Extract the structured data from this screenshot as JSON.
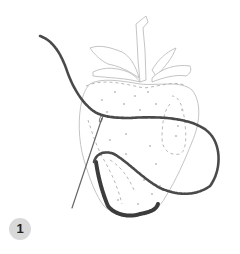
{
  "figure": {
    "step_number": "1",
    "colors": {
      "outline": "#bdbdbd",
      "dashed_guides": "#b0b0b0",
      "seeds": "#c4c4c4",
      "thread": "#4a4a4a",
      "satin_stitch_fill": "#3c3c3c",
      "needle": "#666666",
      "badge_bg": "#d9d9d9",
      "badge_text": "#222222"
    }
  }
}
